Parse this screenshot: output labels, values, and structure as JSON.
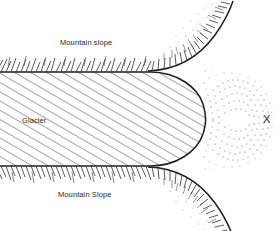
{
  "figure": {
    "background_color": "#fefefe",
    "ink_color": "#2b2b2b"
  },
  "labels": {
    "mountain_slope_top": "Mountain slope",
    "mountain_slope_bottom": "Mountain Slope",
    "glacier": "Glacier",
    "x_marker": "X"
  },
  "features": {
    "glacier_body": {
      "name": "glacier",
      "fill_pattern": "diagonal-hatching",
      "hatch_angle_degrees": 60,
      "hatch_spacing_px": 8,
      "outline_color": "#2b2b2b"
    },
    "mountain_slope_upper": {
      "name": "mountain-slope-upper",
      "pattern": "hachure-ticks",
      "tick_direction": "up"
    },
    "mountain_slope_lower": {
      "name": "mountain-slope-lower",
      "pattern": "hachure-ticks",
      "tick_direction": "down"
    },
    "outwash_deposit": {
      "name": "outwash-stipple",
      "pattern": "stipple",
      "marker": "X"
    }
  }
}
